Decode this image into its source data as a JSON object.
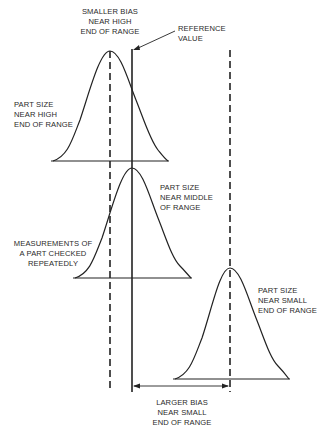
{
  "labels": {
    "smaller_bias": [
      "SMALLER BIAS",
      "NEAR HIGH",
      "END OF RANGE"
    ],
    "reference_value": [
      "REFERENCE",
      "VALUE"
    ],
    "part_size_high": [
      "PART SIZE",
      "NEAR HIGH",
      "END OF RANGE"
    ],
    "part_size_middle": [
      "PART SIZE",
      "NEAR MIDDLE",
      "OF RANGE"
    ],
    "measurements": [
      "MEASUREMENTS OF",
      "A PART CHECKED",
      "REPEATEDLY"
    ],
    "part_size_small": [
      "PART SIZE",
      "NEAR SMALL",
      "END OF RANGE"
    ],
    "larger_bias": [
      "LARGER BIAS",
      "NEAR SMALL",
      "END OF RANGE"
    ]
  },
  "colors": {
    "line": "#222222",
    "background": "#ffffff"
  }
}
